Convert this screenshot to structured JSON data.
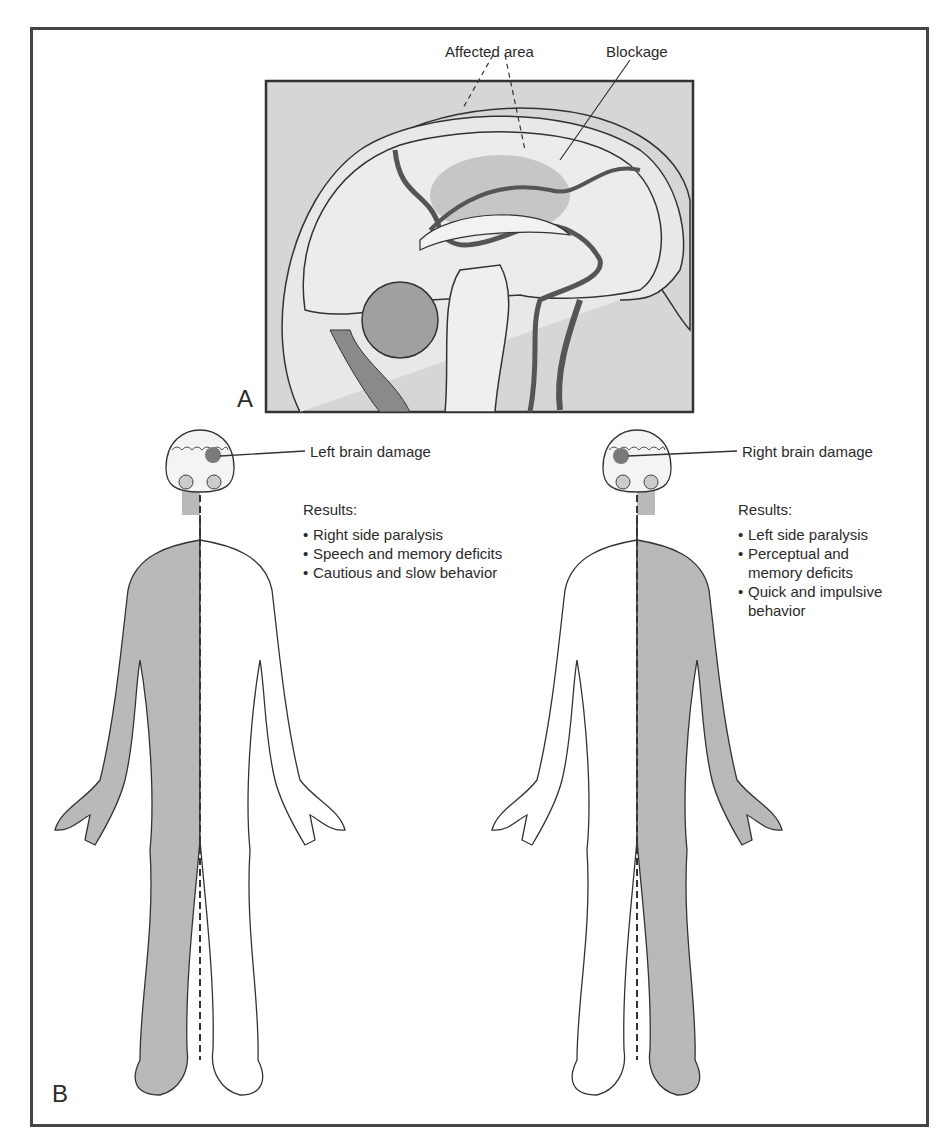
{
  "panel_a": {
    "letter": "A",
    "labels": {
      "affected_area": "Affected area",
      "blockage": "Blockage"
    }
  },
  "panel_b": {
    "letter": "B",
    "left_figure": {
      "label": "Left brain damage",
      "results_heading": "Results:",
      "results": [
        "Right side paralysis",
        "Speech and memory deficits",
        "Cautious and slow behavior"
      ],
      "affected_side": "right"
    },
    "right_figure": {
      "label": "Right brain damage",
      "results_heading": "Results:",
      "results": [
        "Left side paralysis",
        "Perceptual and memory deficits",
        "Quick and impulsive behavior"
      ],
      "affected_side": "left"
    }
  },
  "colors": {
    "frame": "#444444",
    "panel_a_bg": "#d4d4d4",
    "paralysis_shade": "#b8b8b8",
    "lesion": "#7a7a7a"
  }
}
